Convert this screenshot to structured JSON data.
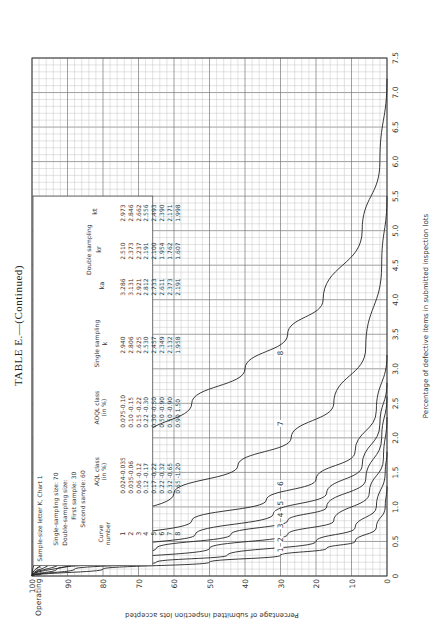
{
  "page": {
    "table_title": "TABLE E.—(Continued)",
    "chart_caption": "Operating Characteristic Curves"
  },
  "info_box": {
    "sample_size_letter": "Sample-size letter K, Chart 1",
    "single_sampling_size": "Single-sampling size: 70",
    "double_sampling_size": "Double-sampling size:",
    "first_sample": "First sample: 30",
    "second_sample": "Second sample: 60",
    "headers": {
      "curve_number": [
        "Curve",
        "number"
      ],
      "aql_class": [
        "AQL class",
        "(in %)"
      ],
      "aoql_class": [
        "AOQL class",
        "(in %)"
      ],
      "single_sampling": [
        "Single sampling",
        "k"
      ],
      "double_sampling": "Double sampling",
      "ka": "ka",
      "kr": "kr",
      "kt": "kt"
    },
    "rows": [
      {
        "curve": "1",
        "aql": "0.024-0.035",
        "aoql": "0.075-0.10",
        "k": "2.940",
        "ka": "3.286",
        "kr": "2.510",
        "kt": "2.973"
      },
      {
        "curve": "2",
        "aql": "0.035-0.06",
        "aoql": "0.10 -0.15",
        "k": "2.806",
        "ka": "3.131",
        "kr": "2.373",
        "kt": "2.846"
      },
      {
        "curve": "3",
        "aql": "0.06 -0.12",
        "aoql": "0.15 -0.22",
        "k": "2.625",
        "ka": "2.921",
        "kr": "2.237",
        "kt": "2.662"
      },
      {
        "curve": "4",
        "aql": "0.12 -0.17",
        "aoql": "0.22 -0.30",
        "k": "2.530",
        "ka": "2.812",
        "kr": "2.191",
        "kt": "2.556"
      },
      {
        "curve": "5",
        "aql": "0.17 -0.22",
        "aoql": "0.30 -0.50",
        "k": "2.457",
        "ka": "2.733",
        "kr": "2.100",
        "kt": "2.493"
      },
      {
        "curve": "6",
        "aql": "0.22 -0.32",
        "aoql": "0.50 -0.90",
        "k": "2.349",
        "ka": "2.611",
        "kr": "1.954",
        "kt": "2.390"
      },
      {
        "curve": "7",
        "aql": "0.32 -0.65",
        "aoql": "0.50 -0.90",
        "k": "2.132",
        "ka": "2.373",
        "kr": "1.762",
        "kt": "2.171"
      },
      {
        "curve": "8",
        "aql": "0.65 -1.20",
        "aoql": "0.90 1.50",
        "k": "1.958",
        "ka": "2.191",
        "kr": "1.607",
        "kt": "1.998"
      }
    ]
  },
  "chart_data": {
    "type": "line",
    "title": "Operating Characteristic Curves",
    "xlabel": "Percentage of defective items in submitted inspection lots",
    "ylabel": "Percentage of submitted inspection lots accepted",
    "xlim": [
      0,
      7.5
    ],
    "ylim": [
      0,
      100
    ],
    "x_ticks": [
      "0",
      "0.5",
      "1.0",
      "1.5",
      "2.0",
      "2.5",
      "3.0",
      "3.5",
      "4.0",
      "4.5",
      "5.0",
      "5.5",
      "6.0",
      "6.5",
      "7.0",
      "7.5"
    ],
    "y_ticks": [
      "0",
      "10",
      "20",
      "30",
      "40",
      "50",
      "60",
      "70",
      "80",
      "90",
      "100"
    ],
    "grid": true,
    "series": [
      {
        "name": "1",
        "x": [
          0,
          0.1,
          0.2,
          0.3,
          0.4,
          0.5,
          0.7,
          1.0,
          1.3
        ],
        "y": [
          100,
          80,
          50,
          30,
          17,
          9,
          3,
          0.5,
          0
        ]
      },
      {
        "name": "2",
        "x": [
          0,
          0.1,
          0.2,
          0.3,
          0.5,
          0.7,
          1.0,
          1.5,
          1.8
        ],
        "y": [
          100,
          88,
          65,
          45,
          20,
          9,
          3,
          0.5,
          0
        ]
      },
      {
        "name": "3",
        "x": [
          0,
          0.1,
          0.2,
          0.4,
          0.6,
          0.8,
          1.2,
          1.7,
          2.3
        ],
        "y": [
          100,
          93,
          80,
          50,
          28,
          15,
          5,
          1,
          0
        ]
      },
      {
        "name": "4",
        "x": [
          0,
          0.2,
          0.4,
          0.6,
          0.8,
          1.0,
          1.4,
          2.0,
          2.6
        ],
        "y": [
          100,
          88,
          65,
          44,
          28,
          17,
          6,
          1.5,
          0
        ]
      },
      {
        "name": "5",
        "x": [
          0,
          0.2,
          0.4,
          0.6,
          0.9,
          1.2,
          1.6,
          2.2,
          2.8
        ],
        "y": [
          100,
          92,
          74,
          54,
          32,
          17,
          7,
          2,
          0
        ]
      },
      {
        "name": "6",
        "x": [
          0,
          0.2,
          0.5,
          0.8,
          1.1,
          1.4,
          1.8,
          2.4,
          3.2
        ],
        "y": [
          100,
          95,
          78,
          55,
          34,
          20,
          9,
          3,
          0
        ]
      },
      {
        "name": "7",
        "x": [
          0,
          0.3,
          0.7,
          1.2,
          1.6,
          2.0,
          2.5,
          3.3,
          4.5,
          5.5
        ],
        "y": [
          100,
          95,
          82,
          60,
          42,
          27,
          15,
          6,
          1.5,
          0
        ]
      },
      {
        "name": "8",
        "x": [
          0,
          0.5,
          1.0,
          1.5,
          2.0,
          2.5,
          3.0,
          3.5,
          4.0,
          5.0,
          6.0,
          7.2
        ],
        "y": [
          100,
          97,
          92,
          80,
          68,
          55,
          40,
          28,
          18,
          7,
          2,
          0
        ]
      }
    ],
    "curve_labels": [
      {
        "label": "1",
        "x": 0.37,
        "y": 30
      },
      {
        "label": "2",
        "x": 0.52,
        "y": 30
      },
      {
        "label": "3",
        "x": 0.72,
        "y": 30
      },
      {
        "label": "4",
        "x": 0.88,
        "y": 30
      },
      {
        "label": "5",
        "x": 1.05,
        "y": 30
      },
      {
        "label": "6",
        "x": 1.33,
        "y": 30
      },
      {
        "label": "7",
        "x": 2.2,
        "y": 30
      },
      {
        "label": "8",
        "x": 3.22,
        "y": 30
      }
    ]
  }
}
